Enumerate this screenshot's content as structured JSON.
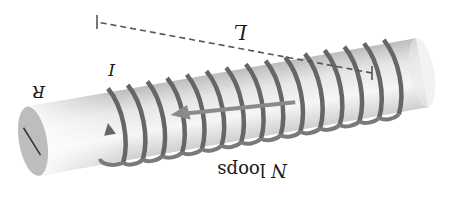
{
  "figure": {
    "orientation_deg": 180,
    "labels": {
      "length": "L",
      "current": "I",
      "radius": "R",
      "loops_var": "N",
      "loops_word": " loops"
    },
    "coil_count": 15,
    "colors": {
      "coil": "#666666",
      "cylinder_light": "#f4f4f4",
      "cylinder_dark": "#c9c9c9",
      "end_cap": "#bdbdbd",
      "arrow": "#8a8a8a",
      "dashed_line": "#555555",
      "text": "#1a1a1a"
    }
  }
}
